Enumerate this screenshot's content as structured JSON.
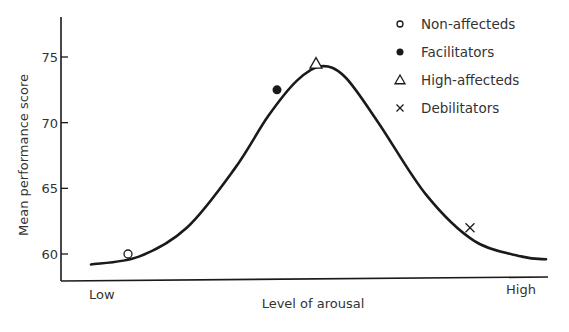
{
  "chart_data": {
    "type": "line",
    "title": "",
    "xlabel": "Level of arousal",
    "ylabel": "Mean performance score",
    "x_tick_labels": [
      "Low",
      "High"
    ],
    "y_ticks": [
      60,
      65,
      70,
      75
    ],
    "ylim": [
      58,
      77
    ],
    "xlim": [
      0,
      1
    ],
    "grid": false,
    "legend_position": "upper right",
    "curve": {
      "name": "Inverted-U arousal-performance curve",
      "shape": "bell",
      "x": [
        0.05,
        0.15,
        0.25,
        0.35,
        0.42,
        0.48,
        0.53,
        0.58,
        0.65,
        0.75,
        0.85,
        0.95,
        1.0
      ],
      "y": [
        59.2,
        59.8,
        62.0,
        66.5,
        70.5,
        73.2,
        74.3,
        73.5,
        70.0,
        64.5,
        61.0,
        59.8,
        59.6
      ]
    },
    "series": [
      {
        "name": "Non-affecteds",
        "marker": "open-circle",
        "x": 0.12,
        "y": 60.0
      },
      {
        "name": "Facilitators",
        "marker": "filled-circle",
        "x": 0.44,
        "y": 72.5
      },
      {
        "name": "High-affecteds",
        "marker": "open-triangle",
        "x": 0.53,
        "y": 74.5
      },
      {
        "name": "Debilitators",
        "marker": "x",
        "x": 0.86,
        "y": 62.0
      }
    ]
  }
}
